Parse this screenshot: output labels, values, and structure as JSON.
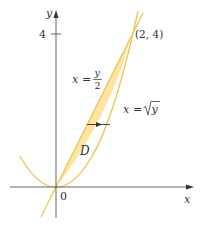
{
  "figure": {
    "type": "region-between-curves",
    "colors": {
      "fill": "#FBE5A0",
      "curve": "#F2C24A",
      "axis": "#555555",
      "text": "#333333",
      "arrow": "#333333"
    },
    "axes": {
      "x_label": "x",
      "y_label": "y",
      "origin_label": "0",
      "y_tick_label": "4",
      "y_tick_value": 4
    },
    "curves": [
      {
        "id": "line",
        "equation_lhs": "x =",
        "equation_num": "y",
        "equation_den": "2",
        "description": "x = y/2"
      },
      {
        "id": "parabola",
        "equation_lhs": "x =",
        "equation_radicand": "y",
        "description": "x = √y"
      }
    ],
    "intersection_point": {
      "label": "(2, 4)",
      "x": 2,
      "y": 4
    },
    "region_label": "D",
    "arrow": {
      "direction": "right",
      "y_value": 1.65
    }
  }
}
